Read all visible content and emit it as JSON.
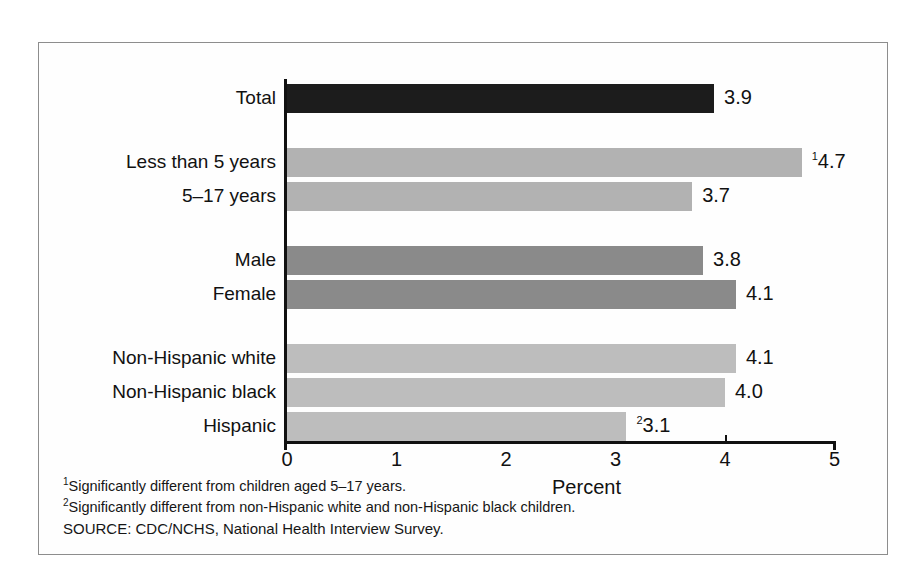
{
  "chart_data": {
    "type": "bar",
    "orientation": "horizontal",
    "title": "",
    "xlabel": "Percent",
    "ylabel": "",
    "xlim": [
      0,
      5
    ],
    "xticks": [
      0,
      1,
      2,
      3,
      4,
      5
    ],
    "xtick_labels": [
      "0",
      "1",
      "2",
      "3",
      "4",
      "5"
    ],
    "grid": false,
    "legend": "none",
    "categories": [
      "Total",
      "Less than 5 years",
      "5–17 years",
      "Male",
      "Female",
      "Non-Hispanic white",
      "Non-Hispanic black",
      "Hispanic"
    ],
    "values": [
      3.9,
      4.7,
      3.7,
      3.8,
      4.1,
      4.1,
      4.0,
      3.1
    ],
    "value_labels": [
      "3.9",
      "4.7",
      "3.7",
      "3.8",
      "4.1",
      "4.1",
      "4.0",
      "3.1"
    ],
    "value_footnote_marks": [
      "",
      "1",
      "",
      "",
      "",
      "",
      "",
      "2"
    ],
    "bar_colors": [
      "#1c1c1c",
      "#b2b2b2",
      "#b2b2b2",
      "#8a8a8a",
      "#8a8a8a",
      "#bdbdbd",
      "#bdbdbd",
      "#bdbdbd"
    ],
    "groups": [
      {
        "name": "total",
        "categories": [
          "Total"
        ]
      },
      {
        "name": "age",
        "categories": [
          "Less than 5 years",
          "5–17 years"
        ]
      },
      {
        "name": "sex",
        "categories": [
          "Male",
          "Female"
        ]
      },
      {
        "name": "race_ethnicity",
        "categories": [
          "Non-Hispanic white",
          "Non-Hispanic black",
          "Hispanic"
        ]
      }
    ]
  },
  "footnotes": [
    {
      "mark": "1",
      "text": "Significantly different from children aged 5–17 years."
    },
    {
      "mark": "2",
      "text": "Significantly different from non-Hispanic white and non-Hispanic black children."
    }
  ],
  "source": "SOURCE: CDC/NCHS, National Health Interview Survey.",
  "colors": {
    "frame_border": "#8d8d8d",
    "axis": "#111111",
    "text": "#111111",
    "background": "#ffffff"
  }
}
